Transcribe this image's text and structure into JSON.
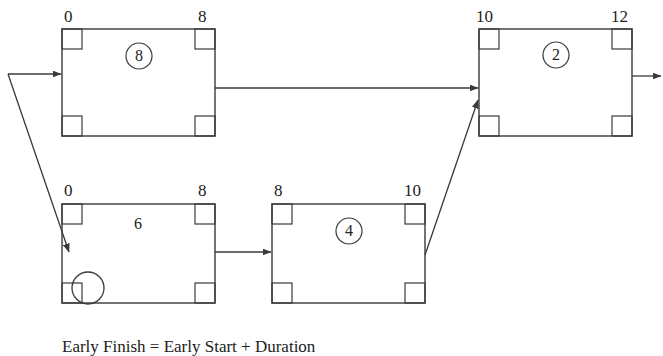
{
  "diagram": {
    "type": "project-network-diagram",
    "caption": "Early Finish = Early Start + Duration",
    "stroke_color": "#3a3a3a",
    "background_color": "#ffffff",
    "nodes": [
      {
        "id": "node-a",
        "early_start": "0",
        "early_finish": "8",
        "duration": "8",
        "duration_circled": true
      },
      {
        "id": "node-b",
        "early_start": "10",
        "early_finish": "12",
        "duration": "2",
        "duration_circled": true
      },
      {
        "id": "node-c",
        "early_start": "0",
        "early_finish": "8",
        "duration": "6",
        "duration_circled": false
      },
      {
        "id": "node-d",
        "early_start": "8",
        "early_finish": "10",
        "duration": "4",
        "duration_circled": true
      }
    ],
    "marker": {
      "label": ""
    }
  }
}
